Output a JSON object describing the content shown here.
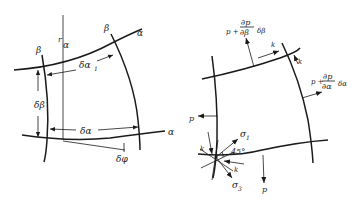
{
  "figure": {
    "left_panel": {
      "name": "curvilinear-element-geometry",
      "labels": {
        "beta_left": "β",
        "beta_right": "β",
        "alpha_top": "α",
        "alpha_bottom": "α",
        "r_alpha": "r",
        "r_alpha_sub": "α",
        "delta_alpha_1": "δα",
        "delta_alpha_1_sub": "1",
        "delta_beta": "δβ",
        "delta_alpha": "δα",
        "delta_phi": "δφ"
      }
    },
    "right_panel": {
      "name": "stress-element-equilibrium",
      "labels": {
        "p_top_base": "p +",
        "p_top_num": "∂p",
        "p_top_den": "∂β",
        "p_top_factor": "δβ",
        "p_right_base": "p +",
        "p_right_num": "∂p",
        "p_right_den": "∂α",
        "p_right_factor": "δα",
        "p_left": "p",
        "p_bottom": "p",
        "k_top": "k",
        "k_right": "k",
        "k_left": "k",
        "k_bottom": "k",
        "sigma_1": "σ",
        "sigma_1_sub": "1",
        "sigma_3": "σ",
        "sigma_3_sub": "3",
        "angle": "45°"
      }
    }
  }
}
